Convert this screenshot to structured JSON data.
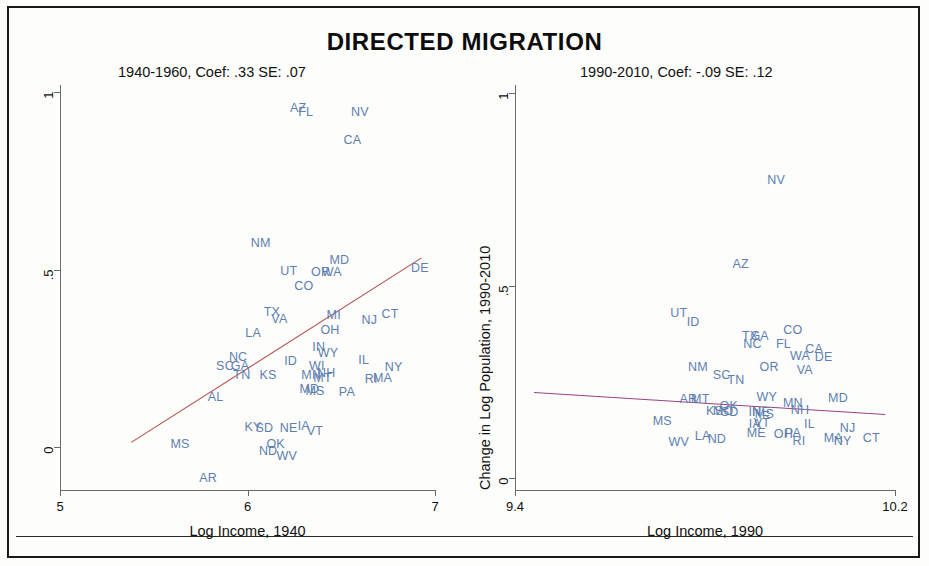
{
  "figure": {
    "title": "DIRECTED MIGRATION",
    "width": 929,
    "height": 566,
    "point_color": "#5e7fb0",
    "text_color": "#111111"
  },
  "chart_data": [
    {
      "type": "scatter",
      "panel": "left",
      "title": "1940-1960, Coef: .33 SE: .07",
      "xlabel": "Log Income, 1940",
      "ylabel": "",
      "xlim": [
        5,
        7
      ],
      "ylim": [
        -0.12,
        1.02
      ],
      "xticks": [
        "5",
        "6",
        "7"
      ],
      "xtickvals": [
        5,
        6,
        7
      ],
      "yticks": [
        "1",
        ".5",
        "0"
      ],
      "ytickvals": [
        1,
        0.5,
        0
      ],
      "grid": false,
      "legend": "none",
      "fit_line": {
        "x0": 5.38,
        "y0": 0.015,
        "x1": 6.93,
        "y1": 0.535,
        "color": "#b04a46"
      },
      "coef": 0.33,
      "se": 0.07,
      "point_label_type": "state-abbreviation",
      "points": [
        {
          "label": "AZ",
          "x": 6.27,
          "y": 0.955
        },
        {
          "label": "FL",
          "x": 6.31,
          "y": 0.945
        },
        {
          "label": "NV",
          "x": 6.6,
          "y": 0.945
        },
        {
          "label": "CA",
          "x": 6.56,
          "y": 0.865
        },
        {
          "label": "NM",
          "x": 6.07,
          "y": 0.575
        },
        {
          "label": "MD",
          "x": 6.49,
          "y": 0.528
        },
        {
          "label": "DE",
          "x": 6.92,
          "y": 0.505
        },
        {
          "label": "UT",
          "x": 6.22,
          "y": 0.497
        },
        {
          "label": "OR",
          "x": 6.39,
          "y": 0.495
        },
        {
          "label": "WA",
          "x": 6.45,
          "y": 0.493
        },
        {
          "label": "CO",
          "x": 6.3,
          "y": 0.455
        },
        {
          "label": "TX",
          "x": 6.13,
          "y": 0.382
        },
        {
          "label": "VA",
          "x": 6.17,
          "y": 0.362
        },
        {
          "label": "MI",
          "x": 6.46,
          "y": 0.372
        },
        {
          "label": "CT",
          "x": 6.76,
          "y": 0.375
        },
        {
          "label": "NJ",
          "x": 6.65,
          "y": 0.358
        },
        {
          "label": "OH",
          "x": 6.44,
          "y": 0.33
        },
        {
          "label": "LA",
          "x": 6.03,
          "y": 0.322
        },
        {
          "label": "IN",
          "x": 6.38,
          "y": 0.283
        },
        {
          "label": "WY",
          "x": 6.43,
          "y": 0.265
        },
        {
          "label": "NC",
          "x": 5.95,
          "y": 0.255
        },
        {
          "label": "ID",
          "x": 6.23,
          "y": 0.243
        },
        {
          "label": "IL",
          "x": 6.62,
          "y": 0.245
        },
        {
          "label": "SC",
          "x": 5.88,
          "y": 0.228
        },
        {
          "label": "GA",
          "x": 5.96,
          "y": 0.23
        },
        {
          "label": "WI",
          "x": 6.37,
          "y": 0.228
        },
        {
          "label": "NY",
          "x": 6.78,
          "y": 0.225
        },
        {
          "label": "TN",
          "x": 5.97,
          "y": 0.205
        },
        {
          "label": "KS",
          "x": 6.11,
          "y": 0.205
        },
        {
          "label": "MN",
          "x": 6.34,
          "y": 0.203
        },
        {
          "label": "NH",
          "x": 6.42,
          "y": 0.21
        },
        {
          "label": "MT",
          "x": 6.4,
          "y": 0.195
        },
        {
          "label": "MA",
          "x": 6.72,
          "y": 0.195
        },
        {
          "label": "RI",
          "x": 6.66,
          "y": 0.193
        },
        {
          "label": "MD2",
          "x": 6.33,
          "y": 0.163
        },
        {
          "label": "MS2",
          "x": 6.36,
          "y": 0.16
        },
        {
          "label": "PA",
          "x": 6.53,
          "y": 0.155
        },
        {
          "label": "AL",
          "x": 5.83,
          "y": 0.142
        },
        {
          "label": "KY",
          "x": 6.03,
          "y": 0.058
        },
        {
          "label": "SD",
          "x": 6.09,
          "y": 0.055
        },
        {
          "label": "NE",
          "x": 6.22,
          "y": 0.055
        },
        {
          "label": "IA",
          "x": 6.3,
          "y": 0.06
        },
        {
          "label": "VT",
          "x": 6.36,
          "y": 0.045
        },
        {
          "label": "MS",
          "x": 5.64,
          "y": 0.01
        },
        {
          "label": "OK",
          "x": 6.15,
          "y": 0.01
        },
        {
          "label": "ND",
          "x": 6.11,
          "y": -0.01
        },
        {
          "label": "WV",
          "x": 6.21,
          "y": -0.025
        },
        {
          "label": "AR",
          "x": 5.79,
          "y": -0.085
        }
      ]
    },
    {
      "type": "scatter",
      "panel": "right",
      "title": "1990-2010, Coef: -.09  SE: .12",
      "xlabel": "Log Income, 1990",
      "ylabel": "Change in Log Population, 1990-2010",
      "xlim": [
        9.4,
        10.2
      ],
      "ylim": [
        -0.03,
        1.02
      ],
      "xticks": [
        "9.4",
        "10.2"
      ],
      "xtickvals": [
        9.4,
        10.2
      ],
      "yticks": [
        "1",
        ".5",
        "0"
      ],
      "ytickvals": [
        1,
        0.5,
        0
      ],
      "grid": false,
      "legend": "none",
      "fit_line": {
        "x0": 9.44,
        "y0": 0.225,
        "x1": 10.18,
        "y1": 0.168,
        "color": "#9c3f86"
      },
      "coef": -0.09,
      "se": 0.12,
      "point_label_type": "state-abbreviation",
      "points": [
        {
          "label": "NV",
          "x": 9.95,
          "y": 0.775
        },
        {
          "label": "AZ",
          "x": 9.875,
          "y": 0.555
        },
        {
          "label": "UT",
          "x": 9.745,
          "y": 0.43
        },
        {
          "label": "ID",
          "x": 9.775,
          "y": 0.405
        },
        {
          "label": "CO",
          "x": 9.985,
          "y": 0.385
        },
        {
          "label": "TX",
          "x": 9.895,
          "y": 0.37
        },
        {
          "label": "GA",
          "x": 9.915,
          "y": 0.37
        },
        {
          "label": "NC",
          "x": 9.9,
          "y": 0.348
        },
        {
          "label": "FL",
          "x": 9.965,
          "y": 0.348
        },
        {
          "label": "WA",
          "x": 10.0,
          "y": 0.318
        },
        {
          "label": "DE",
          "x": 10.05,
          "y": 0.315
        },
        {
          "label": "NM",
          "x": 9.785,
          "y": 0.29
        },
        {
          "label": "OR",
          "x": 9.935,
          "y": 0.29
        },
        {
          "label": "VA",
          "x": 10.01,
          "y": 0.28
        },
        {
          "label": "CA",
          "x": 10.03,
          "y": 0.335
        },
        {
          "label": "SC",
          "x": 9.835,
          "y": 0.268
        },
        {
          "label": "TN",
          "x": 9.865,
          "y": 0.255
        },
        {
          "label": "AR",
          "x": 9.765,
          "y": 0.205
        },
        {
          "label": "MT",
          "x": 9.79,
          "y": 0.205
        },
        {
          "label": "WY",
          "x": 9.93,
          "y": 0.21
        },
        {
          "label": "MD",
          "x": 10.08,
          "y": 0.208
        },
        {
          "label": "MN",
          "x": 9.985,
          "y": 0.195
        },
        {
          "label": "KS",
          "x": 9.82,
          "y": 0.175
        },
        {
          "label": "MO",
          "x": 9.838,
          "y": 0.175
        },
        {
          "label": "OK",
          "x": 9.85,
          "y": 0.188
        },
        {
          "label": "SD",
          "x": 9.852,
          "y": 0.172
        },
        {
          "label": "NH",
          "x": 10.0,
          "y": 0.178
        },
        {
          "label": "IN",
          "x": 9.905,
          "y": 0.172
        },
        {
          "label": "NE",
          "x": 9.918,
          "y": 0.172
        },
        {
          "label": "MS",
          "x": 9.925,
          "y": 0.168
        },
        {
          "label": "IL",
          "x": 10.02,
          "y": 0.14
        },
        {
          "label": "MS2",
          "x": 9.71,
          "y": 0.15
        },
        {
          "label": "IA",
          "x": 9.905,
          "y": 0.14
        },
        {
          "label": "VT",
          "x": 9.92,
          "y": 0.145
        },
        {
          "label": "NJ",
          "x": 10.1,
          "y": 0.13
        },
        {
          "label": "ME",
          "x": 9.908,
          "y": 0.118
        },
        {
          "label": "OH",
          "x": 9.965,
          "y": 0.115
        },
        {
          "label": "PA",
          "x": 9.985,
          "y": 0.118
        },
        {
          "label": "MA",
          "x": 10.07,
          "y": 0.105
        },
        {
          "label": "NY",
          "x": 10.09,
          "y": 0.098
        },
        {
          "label": "CT",
          "x": 10.15,
          "y": 0.105
        },
        {
          "label": "RI",
          "x": 9.998,
          "y": 0.098
        },
        {
          "label": "LA",
          "x": 9.795,
          "y": 0.11
        },
        {
          "label": "ND",
          "x": 9.825,
          "y": 0.103
        },
        {
          "label": "WV",
          "x": 9.745,
          "y": 0.095
        }
      ]
    }
  ]
}
